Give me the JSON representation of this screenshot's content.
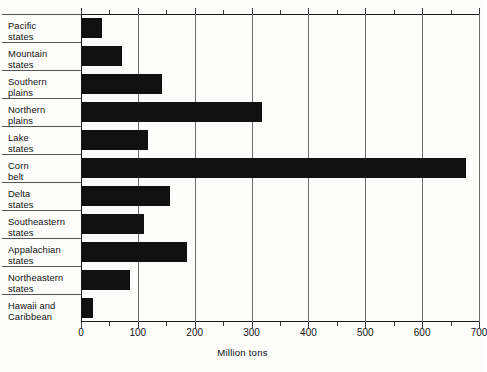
{
  "chart_data": {
    "type": "bar",
    "orientation": "horizontal",
    "title": "",
    "subtitle": "",
    "xlabel": "Million tons",
    "ylabel": "",
    "xlim": [
      0,
      700
    ],
    "xticks": [
      0,
      100,
      200,
      300,
      400,
      500,
      600,
      700
    ],
    "xtick_labels": [
      "0",
      "100",
      "200",
      "300",
      "400",
      "500",
      "600",
      "700"
    ],
    "minor_xticks": [
      50,
      150,
      250,
      350,
      450,
      550,
      650
    ],
    "grid": "vertical-major",
    "legend": "none",
    "bar_color": "#111111",
    "categories": [
      "Pacific states",
      "Mountain states",
      "Southern plains",
      "Northern plains",
      "Lake states",
      "Corn belt",
      "Delta states",
      "Southeastern states",
      "Appalachian states",
      "Northeastern states",
      "Hawaii and Caribbean"
    ],
    "category_lines": [
      [
        "Pacific",
        "states"
      ],
      [
        "Mountain",
        "states"
      ],
      [
        "Southern",
        "plains"
      ],
      [
        "Northern",
        "plains"
      ],
      [
        "Lake",
        "states"
      ],
      [
        "Corn",
        "belt"
      ],
      [
        "Delta",
        "states"
      ],
      [
        "Southeastern",
        "states"
      ],
      [
        "Appalachian",
        "states"
      ],
      [
        "Northeastern",
        "states"
      ],
      [
        "Hawaii and",
        "Caribbean"
      ]
    ],
    "values": [
      37,
      72,
      142,
      318,
      117,
      677,
      156,
      110,
      187,
      86,
      21
    ]
  }
}
